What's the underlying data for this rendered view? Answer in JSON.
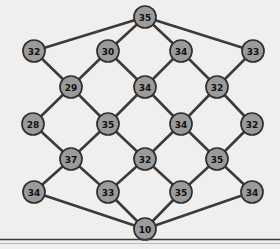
{
  "figure": {
    "title": "",
    "kind": "node-link-diagram",
    "background_color": "#f0efee",
    "node_fill_color": "#9b9b9b",
    "node_stroke_color": "#2f2f2f",
    "edge_color": "#3b3b3b",
    "label_color": "#111111",
    "node_radius": 11,
    "width": 280,
    "height": 249
  },
  "graph": {
    "node_count": 21,
    "edge_count": 36,
    "nodes": [
      {
        "id": "n0",
        "label": "35",
        "x": 145,
        "y": 17,
        "row": 0
      },
      {
        "id": "n1",
        "label": "32",
        "x": 34,
        "y": 51,
        "row": 1
      },
      {
        "id": "n2",
        "label": "30",
        "x": 108,
        "y": 51,
        "row": 1
      },
      {
        "id": "n3",
        "label": "34",
        "x": 181,
        "y": 51,
        "row": 1
      },
      {
        "id": "n4",
        "label": "33",
        "x": 253,
        "y": 51,
        "row": 1
      },
      {
        "id": "n5",
        "label": "29",
        "x": 71,
        "y": 87,
        "row": 2
      },
      {
        "id": "n6",
        "label": "34",
        "x": 145,
        "y": 87,
        "row": 2
      },
      {
        "id": "n7",
        "label": "32",
        "x": 217,
        "y": 87,
        "row": 2
      },
      {
        "id": "n8",
        "label": "28",
        "x": 33,
        "y": 124,
        "row": 3
      },
      {
        "id": "n9",
        "label": "35",
        "x": 108,
        "y": 124,
        "row": 3
      },
      {
        "id": "n10",
        "label": "34",
        "x": 181,
        "y": 124,
        "row": 3
      },
      {
        "id": "n11",
        "label": "32",
        "x": 252,
        "y": 124,
        "row": 3
      },
      {
        "id": "n12",
        "label": "37",
        "x": 71,
        "y": 159,
        "row": 4
      },
      {
        "id": "n13",
        "label": "32",
        "x": 145,
        "y": 159,
        "row": 4
      },
      {
        "id": "n14",
        "label": "35",
        "x": 217,
        "y": 159,
        "row": 4
      },
      {
        "id": "n15",
        "label": "34",
        "x": 34,
        "y": 192,
        "row": 5
      },
      {
        "id": "n16",
        "label": "33",
        "x": 108,
        "y": 192,
        "row": 5
      },
      {
        "id": "n17",
        "label": "35",
        "x": 181,
        "y": 192,
        "row": 5
      },
      {
        "id": "n18",
        "label": "34",
        "x": 252,
        "y": 192,
        "row": 5
      },
      {
        "id": "n19",
        "label": "10",
        "x": 145,
        "y": 229,
        "row": 6
      }
    ],
    "edges": [
      [
        "n0",
        "n1"
      ],
      [
        "n0",
        "n2"
      ],
      [
        "n0",
        "n3"
      ],
      [
        "n0",
        "n4"
      ],
      [
        "n2",
        "n5"
      ],
      [
        "n2",
        "n6"
      ],
      [
        "n3",
        "n6"
      ],
      [
        "n3",
        "n7"
      ],
      [
        "n1",
        "n5"
      ],
      [
        "n4",
        "n7"
      ],
      [
        "n5",
        "n8"
      ],
      [
        "n5",
        "n9"
      ],
      [
        "n6",
        "n9"
      ],
      [
        "n6",
        "n10"
      ],
      [
        "n7",
        "n10"
      ],
      [
        "n7",
        "n11"
      ],
      [
        "n9",
        "n12"
      ],
      [
        "n9",
        "n13"
      ],
      [
        "n10",
        "n13"
      ],
      [
        "n10",
        "n14"
      ],
      [
        "n8",
        "n12"
      ],
      [
        "n11",
        "n14"
      ],
      [
        "n12",
        "n15"
      ],
      [
        "n12",
        "n16"
      ],
      [
        "n13",
        "n16"
      ],
      [
        "n13",
        "n17"
      ],
      [
        "n14",
        "n17"
      ],
      [
        "n14",
        "n18"
      ],
      [
        "n15",
        "n19"
      ],
      [
        "n16",
        "n19"
      ],
      [
        "n17",
        "n19"
      ],
      [
        "n18",
        "n19"
      ]
    ]
  },
  "chart_data": {
    "type": "graph",
    "title": "",
    "xlabel": "",
    "ylabel": "",
    "node_labels": [
      "35",
      "32",
      "30",
      "34",
      "33",
      "29",
      "34",
      "32",
      "28",
      "35",
      "34",
      "32",
      "37",
      "32",
      "35",
      "34",
      "33",
      "35",
      "34",
      "10"
    ],
    "values": [
      35,
      32,
      30,
      34,
      33,
      29,
      34,
      32,
      28,
      35,
      34,
      32,
      37,
      32,
      35,
      34,
      33,
      35,
      34,
      10
    ]
  },
  "footer": {
    "rule_label": ""
  }
}
